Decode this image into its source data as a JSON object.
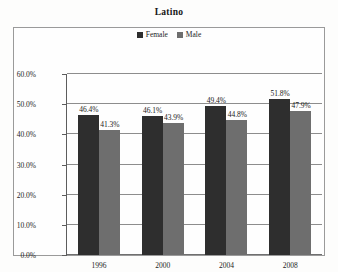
{
  "chart_data": {
    "type": "bar",
    "title": "Latino",
    "xlabel": "",
    "ylabel": "",
    "categories": [
      "1996",
      "2000",
      "2004",
      "2008"
    ],
    "series": [
      {
        "name": "Female",
        "color": "#2e2e2e",
        "values": [
          46.4,
          46.1,
          49.4,
          51.8
        ],
        "labels": [
          "46.4%",
          "46.1%",
          "49.4%",
          "51.8%"
        ]
      },
      {
        "name": "Male",
        "color": "#6e6e6e",
        "values": [
          41.3,
          43.9,
          44.8,
          47.9
        ],
        "labels": [
          "41.3%",
          "43.9%",
          "44.8%",
          "47.9%"
        ]
      }
    ],
    "ylim": [
      0,
      60
    ],
    "ytick_values": [
      60,
      50,
      40,
      30,
      20,
      10,
      0
    ],
    "ytick_labels": [
      "60.0%",
      "50.0%",
      "40.0%",
      "30.0%",
      "20.0%",
      "10.0%",
      "0.0%"
    ],
    "grid": true,
    "legend_position": "top-center"
  }
}
